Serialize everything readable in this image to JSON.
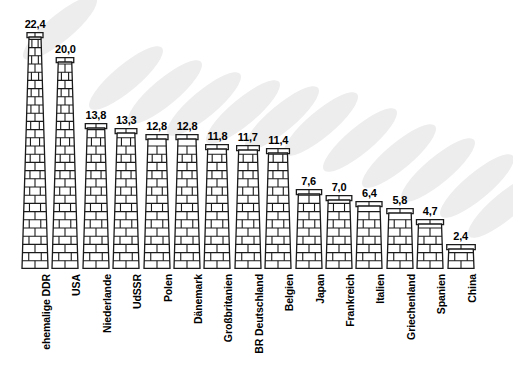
{
  "chart_data": {
    "type": "bar",
    "title": "",
    "subtitle": "",
    "xlabel": "",
    "ylabel": "",
    "ylim": [
      0,
      22.4
    ],
    "grid": false,
    "legend": null,
    "value_format": "german-decimal-comma",
    "categories": [
      "ehemalige DDR",
      "USA",
      "Niederlande",
      "UdSSR",
      "Polen",
      "Dänemark",
      "Großbritanien",
      "BR Deutschland",
      "Belgien",
      "Japan",
      "Frankreich",
      "Italien",
      "Griechenland",
      "Spanien",
      "China"
    ],
    "values": [
      22.4,
      20.0,
      13.8,
      13.3,
      12.8,
      12.8,
      11.8,
      11.7,
      11.4,
      7.6,
      7.0,
      6.4,
      5.8,
      4.7,
      2.4
    ],
    "value_labels": [
      "22,4",
      "20,0",
      "13,8",
      "13,3",
      "12,8",
      "12,8",
      "11,8",
      "11,7",
      "11,4",
      "7,6",
      "7,0",
      "6,4",
      "5,8",
      "4,7",
      "2,4"
    ]
  },
  "bars": [
    {
      "label": "ehemalige DDR",
      "value": 22.4,
      "value_label": "22,4"
    },
    {
      "label": "USA",
      "value": 20.0,
      "value_label": "20,0"
    },
    {
      "label": "Niederlande",
      "value": 13.8,
      "value_label": "13,8"
    },
    {
      "label": "UdSSR",
      "value": 13.3,
      "value_label": "13,3"
    },
    {
      "label": "Polen",
      "value": 12.8,
      "value_label": "12,8"
    },
    {
      "label": "Dänemark",
      "value": 12.8,
      "value_label": "12,8"
    },
    {
      "label": "Großbritanien",
      "value": 11.8,
      "value_label": "11,8"
    },
    {
      "label": "BR Deutschland",
      "value": 11.7,
      "value_label": "11,7"
    },
    {
      "label": "Belgien",
      "value": 11.4,
      "value_label": "11,4"
    },
    {
      "label": "Japan",
      "value": 7.6,
      "value_label": "7,6"
    },
    {
      "label": "Frankreich",
      "value": 7.0,
      "value_label": "7,0"
    },
    {
      "label": "Italien",
      "value": 6.4,
      "value_label": "6,4"
    },
    {
      "label": "Griechenland",
      "value": 5.8,
      "value_label": "5,8"
    },
    {
      "label": "Spanien",
      "value": 4.7,
      "value_label": "4,7"
    },
    {
      "label": "China",
      "value": 2.4,
      "value_label": "2,4"
    }
  ],
  "style": {
    "bar_fill": "#ffffff",
    "bar_stroke": "#1a1a1a",
    "smoke_color": "#ededed",
    "background": "#ffffff",
    "text_color": "#000000"
  }
}
